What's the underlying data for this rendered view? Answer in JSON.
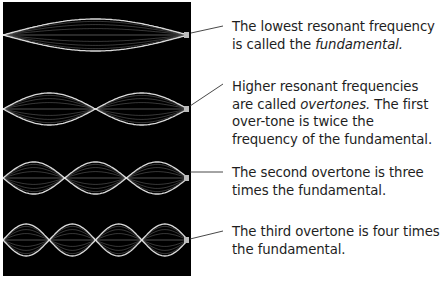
{
  "figure": {
    "panel_color": "#000000",
    "wave_color": "#e8e8e8",
    "strings": [
      {
        "id": "fundamental",
        "loops": 1,
        "center_y": 33,
        "amplitude": 16
      },
      {
        "id": "first-overtone",
        "loops": 2,
        "center_y": 107,
        "amplitude": 16
      },
      {
        "id": "second-overtone",
        "loops": 3,
        "center_y": 176,
        "amplitude": 16
      },
      {
        "id": "third-overtone",
        "loops": 4,
        "center_y": 238,
        "amplitude": 16
      }
    ]
  },
  "captions": [
    {
      "pre": "The lowest resonant frequency is called the ",
      "em": "fundamental.",
      "post": ""
    },
    {
      "pre": "Higher resonant frequencies are called ",
      "em": "overtones.",
      "post": " The first over-tone is twice the frequency of the fundamental."
    },
    {
      "pre": "The second overtone is three times the fundamental.",
      "em": "",
      "post": ""
    },
    {
      "pre": "The third overtone is four times the fundamental.",
      "em": "",
      "post": ""
    }
  ]
}
